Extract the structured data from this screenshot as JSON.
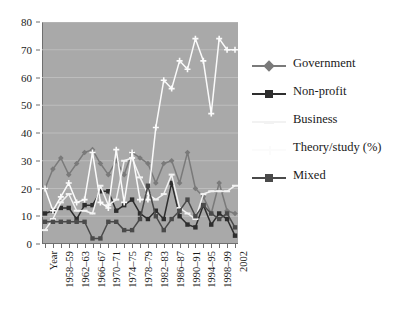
{
  "chart_data": {
    "type": "line",
    "title": "",
    "subtitle": "",
    "xlabel": "Year",
    "ylabel": "",
    "ylim": [
      0,
      80
    ],
    "ytick_step": 10,
    "yticks": [
      0,
      10,
      20,
      30,
      40,
      50,
      60,
      70,
      80
    ],
    "grid": true,
    "grid_axis": "y",
    "legend_position": "right",
    "plot_background": "#a9a9a9",
    "x": [
      "Year",
      "1956-57",
      "1958-59",
      "1960-61",
      "1962-63",
      "1964-65",
      "1966-67",
      "1968-69",
      "1970-71",
      "1972-73",
      "1974-75",
      "1976-77",
      "1978-79",
      "1980-81",
      "1982-83",
      "1984-85",
      "1986-87",
      "1988-89",
      "1990-91",
      "1992-93",
      "1994-95",
      "1996-97",
      "1998-99",
      "2000-01",
      "2002"
    ],
    "xtick_labels": [
      "Year",
      "1958-59",
      "1962-63",
      "1966-67",
      "1970-71",
      "1974-75",
      "1978-79",
      "1982-83",
      "1986-87",
      "1990-91",
      "1994-95",
      "1998-99",
      "2002"
    ],
    "n_points": 25,
    "series": [
      {
        "name": "Government",
        "color": "#7a7a7a",
        "marker": "diamond",
        "values": [
          20,
          27,
          31,
          25,
          29,
          33,
          34,
          29,
          25,
          30,
          25,
          33,
          31,
          29,
          22,
          29,
          30,
          22,
          33,
          20,
          17,
          11,
          22,
          12,
          11
        ]
      },
      {
        "name": "Non-profit",
        "color": "#2e2e2e",
        "marker": "square",
        "values": [
          11,
          12,
          13,
          13,
          9,
          14,
          14,
          19,
          19,
          12,
          14,
          16,
          11,
          9,
          12,
          9,
          22,
          10,
          7,
          6,
          14,
          7,
          11,
          9,
          3
        ]
      },
      {
        "name": "Business",
        "color": "#f2f2f2",
        "marker": "dash",
        "values": [
          5,
          9,
          15,
          18,
          12,
          12,
          11,
          21,
          14,
          16,
          30,
          31,
          24,
          18,
          16,
          18,
          25,
          13,
          11,
          9,
          18,
          19,
          19,
          19,
          21
        ]
      },
      {
        "name": "Theory/study (%)",
        "color": "#fbfbfb",
        "marker": "cross",
        "values": [
          20,
          12,
          17,
          22,
          15,
          16,
          33,
          15,
          13,
          34,
          15,
          33,
          16,
          16,
          42,
          59,
          56,
          66,
          63,
          74,
          66,
          47,
          74,
          70,
          70
        ]
      },
      {
        "name": "Mixed",
        "color": "#4a4a4a",
        "marker": "square",
        "values": [
          8,
          8,
          8,
          8,
          8,
          8,
          2,
          2,
          8,
          8,
          5,
          5,
          9,
          21,
          10,
          5,
          9,
          12,
          16,
          10,
          14,
          11,
          9,
          11,
          6
        ]
      }
    ]
  },
  "legend": {
    "items": [
      {
        "label": "Government"
      },
      {
        "label": "Non-profit"
      },
      {
        "label": "Business"
      },
      {
        "label": "Theory/study (%)"
      },
      {
        "label": "Mixed"
      }
    ]
  }
}
